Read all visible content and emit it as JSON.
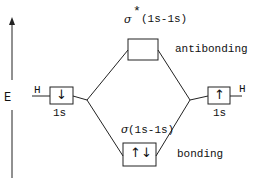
{
  "diagram": {
    "axis_label": "E",
    "left_atom": {
      "label": "H",
      "orbital": "1s",
      "electrons": "↓"
    },
    "right_atom": {
      "label": "H",
      "orbital": "1s",
      "electrons": "↑"
    },
    "antibonding": {
      "symbol": "σ",
      "star": "*",
      "orbital": "(1s-1s)",
      "label": "antibonding",
      "electrons": ""
    },
    "bonding": {
      "symbol": "σ",
      "orbital": "(1s-1s)",
      "label": "bonding",
      "electrons": "↑↓"
    }
  }
}
